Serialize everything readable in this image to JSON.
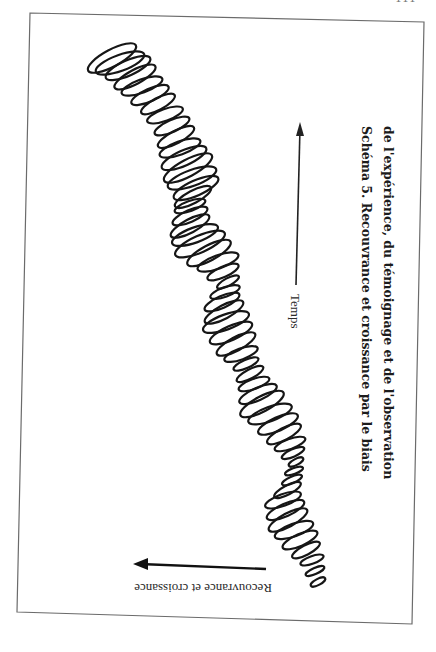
{
  "page": {
    "page_number": "111"
  },
  "diagram": {
    "title_line_1": "Schéma 5.  Recouvrance et croissance par le biais",
    "title_line_2": "de l'expérience, du témoignage et de l'observation",
    "x_axis_label": "Temps",
    "y_axis_label": "Recouvrance et croissance",
    "spiral_description": "hand-drawn looping spiral trending from lower-left to upper-left over time",
    "colors": {
      "ink": "#1a1a1a",
      "frame": "#666666",
      "background": "#ffffff"
    }
  }
}
